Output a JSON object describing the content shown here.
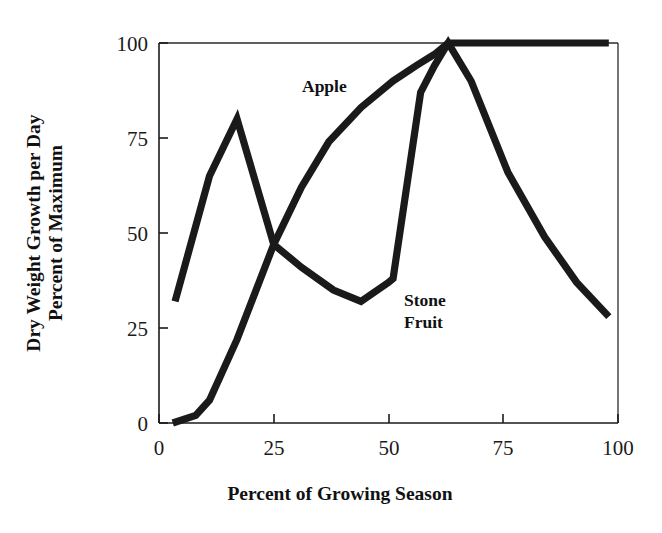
{
  "chart_data": {
    "type": "line",
    "title": "",
    "xlabel": "Percent of Growing Season",
    "ylabel_line1": "Dry Weight Growth per Day",
    "ylabel_line2": "Percent of Maximum",
    "xlim": [
      0,
      100
    ],
    "ylim": [
      0,
      100
    ],
    "xticks": [
      0,
      25,
      50,
      75,
      100
    ],
    "yticks": [
      0,
      25,
      50,
      75,
      100
    ],
    "xtick_labels": [
      "0",
      "25",
      "50",
      "75",
      "100"
    ],
    "ytick_labels": [
      "0",
      "25",
      "50",
      "75",
      "100"
    ],
    "grid": false,
    "legend": "inline-annotations",
    "series": [
      {
        "name": "Apple",
        "label_text": "Apple",
        "label_x": 30,
        "label_y": 90,
        "color": "#1a1a1a",
        "points": [
          [
            3,
            0
          ],
          [
            8,
            2
          ],
          [
            11,
            6
          ],
          [
            17,
            22
          ],
          [
            25,
            47
          ],
          [
            31,
            62
          ],
          [
            37,
            74
          ],
          [
            44,
            83
          ],
          [
            51,
            90
          ],
          [
            56,
            94
          ],
          [
            60,
            97
          ],
          [
            63,
            100
          ],
          [
            75,
            100
          ],
          [
            88,
            100
          ],
          [
            98,
            100
          ]
        ]
      },
      {
        "name": "Stone Fruit",
        "label_text_line1": "Stone",
        "label_text_line2": "Fruit",
        "label_x": 57,
        "label_y": 33,
        "color": "#1a1a1a",
        "points": [
          [
            3.5,
            32
          ],
          [
            11,
            65
          ],
          [
            17,
            80
          ],
          [
            25,
            47
          ],
          [
            31,
            41
          ],
          [
            38,
            35
          ],
          [
            44,
            32
          ],
          [
            50,
            37
          ],
          [
            51,
            38
          ],
          [
            57,
            87
          ],
          [
            60,
            94
          ],
          [
            63,
            100
          ],
          [
            68,
            90
          ],
          [
            76,
            66
          ],
          [
            84,
            49
          ],
          [
            91,
            37
          ],
          [
            98,
            28
          ]
        ]
      }
    ]
  },
  "axes": {
    "x_title": "Percent of Growing Season",
    "y_title_line1": "Dry Weight Growth per Day",
    "y_title_line2": "Percent of Maximum"
  },
  "annotations": {
    "apple": "Apple",
    "stone_line1": "Stone",
    "stone_line2": "Fruit"
  }
}
